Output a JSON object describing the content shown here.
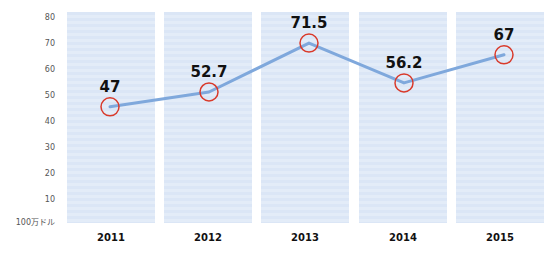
{
  "chart_data": {
    "type": "line",
    "title": "",
    "xlabel": "",
    "ylabel": "100万ドル",
    "categories": [
      "2011",
      "2012",
      "2013",
      "2014",
      "2015"
    ],
    "values": [
      47,
      52.7,
      71.5,
      56.2,
      67
    ],
    "value_labels": [
      "47",
      "52.7",
      "71.5",
      "56.2",
      "67"
    ],
    "y_ticks": [
      "80",
      "70",
      "60",
      "50",
      "40",
      "30",
      "20",
      "10"
    ],
    "y_unit_label": "100万ドル",
    "ylim": [
      0,
      80
    ],
    "grid": false,
    "legend": null,
    "colors": {
      "line": "#7fa8dc",
      "marker": "#d93a2b",
      "panel": "#dbe6f6",
      "label": "#111111"
    }
  }
}
